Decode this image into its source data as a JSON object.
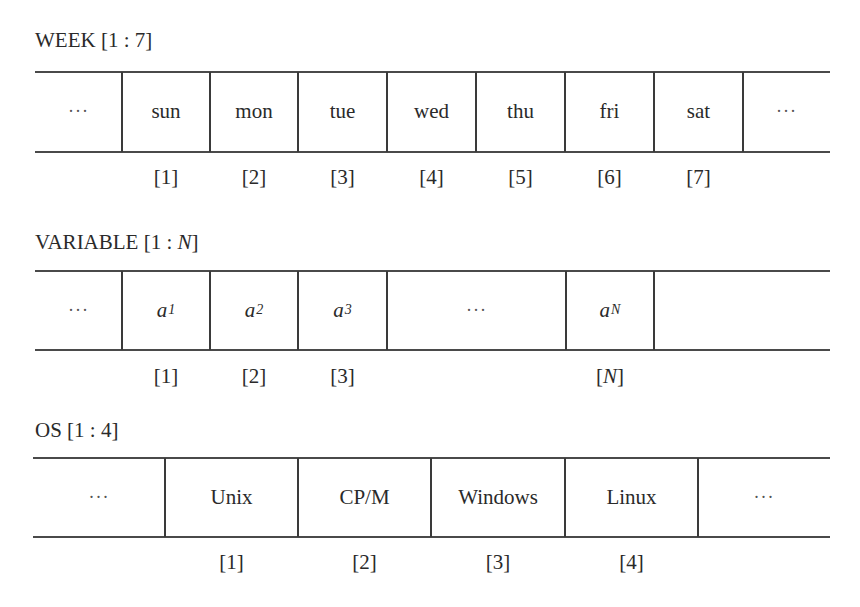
{
  "diagram": {
    "type": "array-illustrations",
    "arrays": [
      {
        "name": "WEEK",
        "range_label": "[1 : 7]",
        "title": "WEEK [1 : 7]",
        "leading_ellipsis": "···",
        "trailing_ellipsis": "···",
        "cells": [
          {
            "value": "sun",
            "index": "[1]"
          },
          {
            "value": "mon",
            "index": "[2]"
          },
          {
            "value": "tue",
            "index": "[3]"
          },
          {
            "value": "wed",
            "index": "[4]"
          },
          {
            "value": "thu",
            "index": "[5]"
          },
          {
            "value": "fri",
            "index": "[6]"
          },
          {
            "value": "sat",
            "index": "[7]"
          }
        ]
      },
      {
        "name": "VARIABLE",
        "title_prefix": "VARIABLE [1 : ",
        "title_var": "N",
        "title_suffix": "]",
        "leading_ellipsis": "···",
        "middle_ellipsis": "···",
        "cells": [
          {
            "base": "a",
            "sub": "1",
            "index": "[1]"
          },
          {
            "base": "a",
            "sub": "2",
            "index": "[2]"
          },
          {
            "base": "a",
            "sub": "3",
            "index": "[3]"
          },
          {
            "base": "a",
            "sub": "N",
            "index_prefix": "[",
            "index_var": "N",
            "index_suffix": "]"
          }
        ]
      },
      {
        "name": "OS",
        "title": "OS [1 : 4]",
        "leading_ellipsis": "···",
        "trailing_ellipsis": "···",
        "cells": [
          {
            "value": "Unix",
            "index": "[1]"
          },
          {
            "value": "CP/M",
            "index": "[2]"
          },
          {
            "value": "Windows",
            "index": "[3]"
          },
          {
            "value": "Linux",
            "index": "[4]"
          }
        ]
      }
    ]
  }
}
